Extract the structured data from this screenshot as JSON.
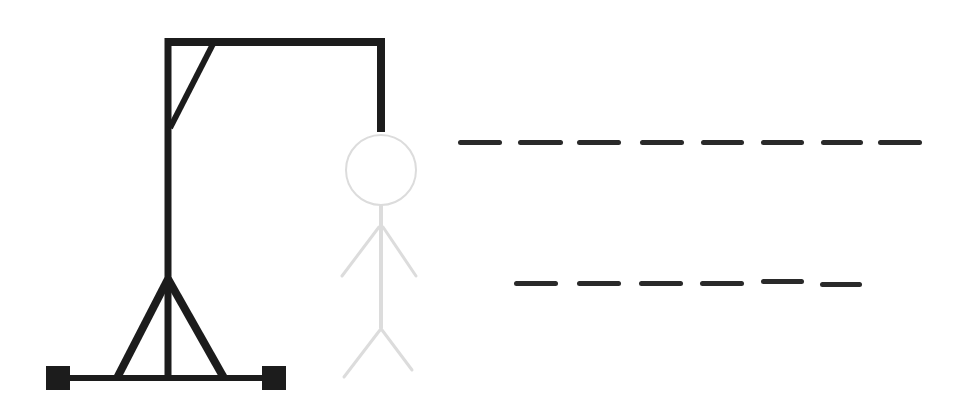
{
  "game": {
    "title": "Hangman",
    "colors": {
      "gallows": "#1c1c1c",
      "figure_hidden": "#dcdcdc",
      "blank": "#2a2a2a",
      "background": "#ffffff"
    },
    "gallows_parts": [
      "base",
      "left-foot",
      "right-foot",
      "tripod-left",
      "tripod-right",
      "upright",
      "top-beam",
      "brace",
      "rope"
    ],
    "figure_parts": [
      {
        "name": "head",
        "revealed": false
      },
      {
        "name": "body",
        "revealed": false
      },
      {
        "name": "left-arm",
        "revealed": false
      },
      {
        "name": "right-arm",
        "revealed": false
      },
      {
        "name": "left-leg",
        "revealed": false
      },
      {
        "name": "right-leg",
        "revealed": false
      }
    ],
    "words": [
      {
        "length": 8,
        "letters": [
          "",
          "",
          "",
          "",
          "",
          "",
          "",
          ""
        ]
      },
      {
        "length": 6,
        "letters": [
          "",
          "",
          "",
          "",
          "",
          ""
        ]
      }
    ]
  }
}
